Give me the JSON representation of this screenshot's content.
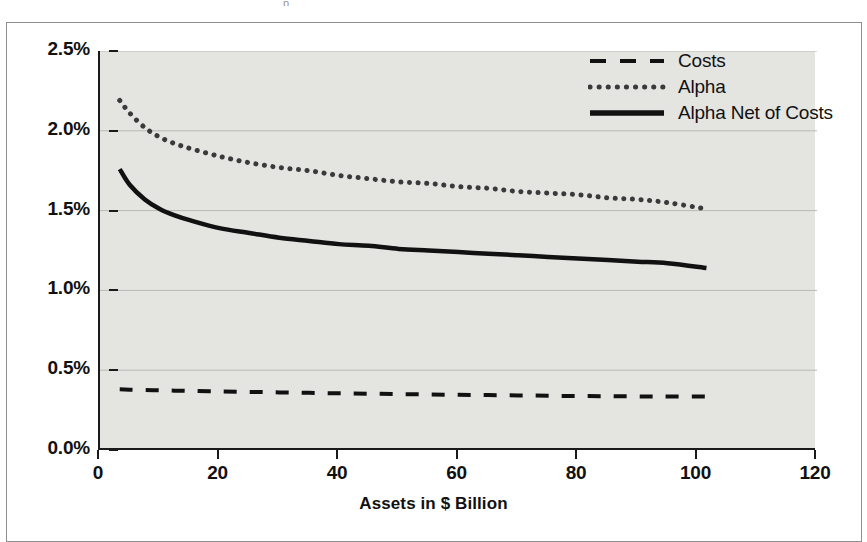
{
  "figure": {
    "clipped_caption_fragment": "p",
    "background_color": "#ffffff",
    "plot_background_color": "#e4e4e1",
    "frame_color": "#8f8f8f",
    "axis_color": "#1a1a1a"
  },
  "chart_data": {
    "type": "line",
    "title": "",
    "subtitle": "",
    "xlabel": "Assets in $ Billion",
    "ylabel": "",
    "xlim": [
      0,
      120
    ],
    "ylim": [
      0,
      2.5
    ],
    "xticks": [
      "0",
      "20",
      "40",
      "60",
      "80",
      "100",
      "120"
    ],
    "xtick_values": [
      0,
      20,
      40,
      60,
      80,
      100,
      120
    ],
    "yticks": [
      "0.0%",
      "0.5%",
      "1.0%",
      "1.5%",
      "2.0%",
      "2.5%"
    ],
    "ytick_values": [
      0.0,
      0.5,
      1.0,
      1.5,
      2.0,
      2.5
    ],
    "grid": true,
    "grid_axis": "y",
    "legend_position": "top-right",
    "x": [
      3.3,
      5,
      7.5,
      10,
      12.5,
      15,
      20,
      25,
      30,
      35,
      40,
      45,
      50,
      55,
      60,
      65,
      70,
      75,
      80,
      85,
      90,
      95,
      101.5
    ],
    "series": [
      {
        "name": "Costs",
        "style": "dashed",
        "color": "#111111",
        "values": [
          0.38,
          0.378,
          0.376,
          0.374,
          0.372,
          0.37,
          0.367,
          0.364,
          0.361,
          0.358,
          0.355,
          0.353,
          0.35,
          0.348,
          0.346,
          0.344,
          0.342,
          0.34,
          0.338,
          0.337,
          0.336,
          0.335,
          0.335
        ]
      },
      {
        "name": "Alpha",
        "style": "dotted",
        "color": "#3a3a3a",
        "values": [
          2.19,
          2.11,
          2.02,
          1.96,
          1.92,
          1.89,
          1.84,
          1.8,
          1.77,
          1.75,
          1.72,
          1.7,
          1.68,
          1.67,
          1.65,
          1.64,
          1.62,
          1.61,
          1.6,
          1.58,
          1.57,
          1.55,
          1.51
        ]
      },
      {
        "name": "Alpha Net of Costs",
        "style": "solid",
        "color": "#111111",
        "values": [
          1.76,
          1.66,
          1.57,
          1.51,
          1.47,
          1.44,
          1.39,
          1.36,
          1.33,
          1.31,
          1.29,
          1.28,
          1.26,
          1.25,
          1.24,
          1.23,
          1.22,
          1.21,
          1.2,
          1.19,
          1.18,
          1.17,
          1.14
        ]
      }
    ],
    "legend_entries": [
      {
        "label": "Costs",
        "style": "dashed"
      },
      {
        "label": "Alpha",
        "style": "dotted"
      },
      {
        "label": "Alpha Net of Costs",
        "style": "solid"
      }
    ]
  }
}
